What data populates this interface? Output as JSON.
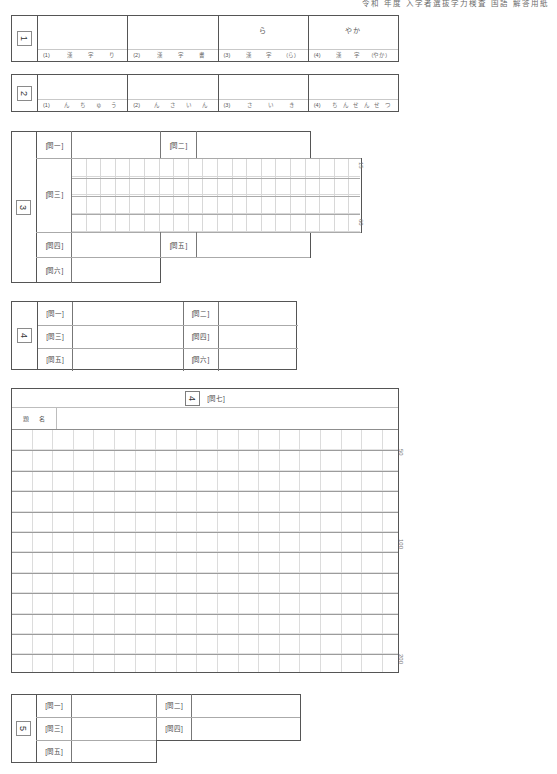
{
  "document": {
    "header_note": "令和 年度 入学者選抜学力検査 国語 解答用紙"
  },
  "sections": [
    {
      "number": "1",
      "name": "section-1-kanji-reading",
      "cells": [
        {
          "question": "(1)",
          "answer": "",
          "furigana": [
            "漢",
            "字",
            "り"
          ]
        },
        {
          "question": "(2)",
          "answer": "",
          "furigana": [
            "漢",
            "字",
            "書"
          ]
        },
        {
          "question": "(3)",
          "answer": "ら",
          "furigana": [
            "漢",
            "字",
            "(ら)"
          ]
        },
        {
          "question": "(4)",
          "answer": "やか",
          "furigana": [
            "漢",
            "字",
            "(やか)"
          ]
        }
      ]
    },
    {
      "number": "2",
      "name": "section-2-kana",
      "cells": [
        {
          "question": "(1)",
          "answer": "",
          "furigana": [
            "ん",
            "ち",
            "ゅ",
            "う"
          ]
        },
        {
          "question": "(2)",
          "answer": "",
          "furigana": [
            "ん",
            "さ",
            "い",
            "ん"
          ]
        },
        {
          "question": "(3)",
          "answer": "",
          "furigana": [
            "さ",
            "い",
            "き"
          ]
        },
        {
          "question": "(4)",
          "answer": "",
          "furigana": [
            "ち",
            "ん",
            "せ",
            "ん",
            "せ",
            "つ",
            "ん"
          ]
        }
      ]
    },
    {
      "number": "3",
      "name": "section-3-reading-comprehension",
      "labels": [
        "[問一]",
        "[問二]",
        "[問三]",
        "[問四]",
        "[問五]",
        "[問六]"
      ],
      "grid": {
        "columns": 20,
        "rows": 4
      },
      "count_marks": [
        "15",
        "60"
      ]
    },
    {
      "number": "4",
      "name": "section-4-short-answer",
      "labels": [
        "[問一]",
        "[問二]",
        "[問三]",
        "[問四]",
        "[問五]",
        "[問六]"
      ]
    },
    {
      "number": "4",
      "name": "section-composition",
      "heading_label": "[問七]",
      "title_row_label": [
        "題",
        "名"
      ],
      "grid": {
        "columns": 20,
        "rows": 11
      },
      "count_marks": [
        "50",
        "100",
        "200"
      ]
    },
    {
      "number": "5",
      "name": "section-5-classical",
      "labels": [
        "[問一]",
        "[問二]",
        "[問三]",
        "[問四]",
        "[問五]"
      ]
    }
  ]
}
